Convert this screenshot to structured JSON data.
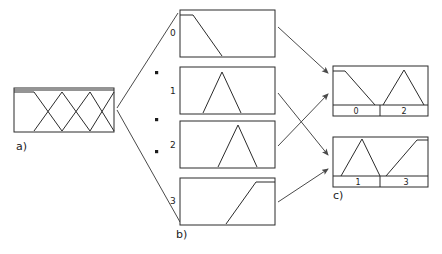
{
  "figure": {
    "background_color": "#ffffff",
    "line_color": "#2b2b2b",
    "arrow_color": "#4a4a4a",
    "width": 442,
    "height": 254
  },
  "panels": {
    "a": {
      "caption": "a)",
      "description": "combined overlapping membership functions",
      "box": {
        "x": 14,
        "y": 88,
        "w": 100,
        "h": 44
      },
      "curves": [
        {
          "name": "set-0",
          "points": "14,92 34,92 62,131"
        },
        {
          "name": "set-1",
          "points": "34,131 62,92 90,131"
        },
        {
          "name": "set-2",
          "points": "62,131 90,92 114,131"
        },
        {
          "name": "set-3",
          "points": "90,131 114,92"
        },
        {
          "name": "top-rail",
          "points": "14,90 114,90"
        }
      ]
    },
    "b": {
      "caption": "b)",
      "description": "individual membership functions separated",
      "items": [
        {
          "label": "0",
          "shape": "descending-ramp",
          "box": {
            "x": 180,
            "y": 10,
            "w": 95,
            "h": 47
          },
          "curve": "180,15 193,15 222,56"
        },
        {
          "label": "1",
          "shape": "triangle-left-of-center",
          "box": {
            "x": 180,
            "y": 67,
            "w": 95,
            "h": 47
          },
          "curve": "203,113 222,72 241,113"
        },
        {
          "label": "2",
          "shape": "triangle-right-of-center",
          "box": {
            "x": 180,
            "y": 121,
            "w": 95,
            "h": 47
          },
          "curve": "218,167 238,125 257,167"
        },
        {
          "label": "3",
          "shape": "ascending-ramp",
          "box": {
            "x": 180,
            "y": 178,
            "w": 95,
            "h": 47
          },
          "curve": "226,224 256,182 275,182"
        }
      ],
      "dots": [
        {
          "x": 157,
          "y": 73
        },
        {
          "x": 157,
          "y": 120
        },
        {
          "x": 157,
          "y": 152
        }
      ]
    },
    "c": {
      "caption": "c)",
      "description": "recombined membership function groups",
      "items": [
        {
          "name": "group-even",
          "box": {
            "x": 333,
            "y": 66,
            "w": 95,
            "h": 50
          },
          "baseline_y": 105,
          "divider_x": 380,
          "curves": [
            {
              "name": "set-0",
              "points": "333,71 345,71 375,105"
            },
            {
              "name": "set-2",
              "points": "383,105 404,70 424,105"
            }
          ],
          "axis_labels": [
            {
              "text": "0",
              "x": 356,
              "y": 110
            },
            {
              "text": "2",
              "x": 404,
              "y": 110
            }
          ]
        },
        {
          "name": "group-odd",
          "box": {
            "x": 333,
            "y": 137,
            "w": 95,
            "h": 50
          },
          "baseline_y": 176,
          "divider_x": 380,
          "curves": [
            {
              "name": "set-1",
              "points": "341,176 362,139 380,176"
            },
            {
              "name": "set-3",
              "points": "386,176 417,140 428,140"
            }
          ],
          "axis_labels": [
            {
              "text": "1",
              "x": 358,
              "y": 181
            },
            {
              "text": "3",
              "x": 406,
              "y": 181
            }
          ]
        }
      ]
    }
  },
  "connectors": {
    "fanout": [
      {
        "name": "a-to-box-0",
        "points": "117,108 178,13"
      },
      {
        "name": "a-to-box-3",
        "points": "117,110 180,222"
      }
    ],
    "arrows": [
      {
        "name": "box-0-to-group-even",
        "x1": 278,
        "y1": 27,
        "x2": 330,
        "y2": 74
      },
      {
        "name": "box-1-to-group-odd",
        "x1": 278,
        "y1": 93,
        "x2": 330,
        "y2": 156
      },
      {
        "name": "box-2-to-group-even",
        "x1": 278,
        "y1": 146,
        "x2": 330,
        "y2": 94
      },
      {
        "name": "box-3-to-group-odd",
        "x1": 278,
        "y1": 202,
        "x2": 330,
        "y2": 170
      }
    ]
  },
  "captions": {
    "a": {
      "text": "a)",
      "x": 16,
      "y": 147
    },
    "b": {
      "text": "b)",
      "x": 176,
      "y": 235
    },
    "c": {
      "text": "c)",
      "x": 333,
      "y": 196
    }
  }
}
